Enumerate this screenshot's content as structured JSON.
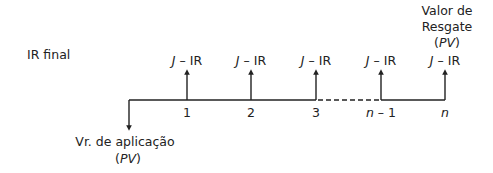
{
  "diagram": {
    "title_label": "IR final",
    "flow_label": "J – IR",
    "flow_label_italic": "J",
    "flow_label_rest": " – IR",
    "periods": [
      "1",
      "2",
      "3",
      "n – 1",
      "n"
    ],
    "period_n1_italic": "n",
    "period_n1_rest": " – 1",
    "period_n": "n",
    "outflow_label_line1": "Vr. de aplicação",
    "outflow_label_line2": "(PV)",
    "pv": "PV",
    "final_label_line1": "Valor de",
    "final_label_line2": "Resgate",
    "final_label_line3": "(PV)"
  }
}
